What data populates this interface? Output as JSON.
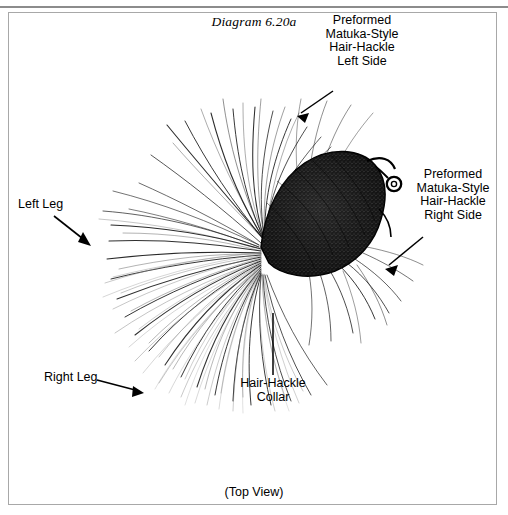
{
  "figure": {
    "title": "Diagram 6.20a",
    "caption": "(Top View)"
  },
  "callouts": {
    "left_hackle": "Preformed\nMatuka-Style\nHair-Hackle\nLeft Side",
    "right_hackle": "Preformed\nMatuka-Style\nHair-Hackle\nRight Side",
    "left_leg": "Left Leg",
    "right_leg": "Right Leg",
    "collar": "Hair-Hackle\nCollar"
  },
  "colors": {
    "ink": "#000000",
    "frame": "#a8a8a8",
    "rule": "#8c8c8c",
    "page": "#ffffff"
  }
}
